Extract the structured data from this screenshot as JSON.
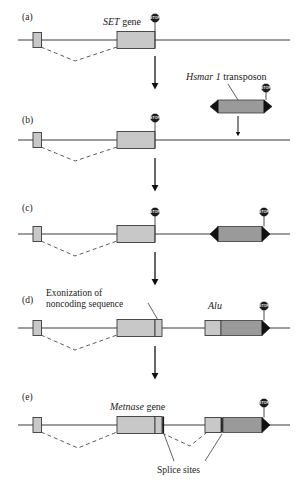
{
  "figure": {
    "background_color": "#ffffff",
    "line_color": "#3a3a3a",
    "exon_fill_light": "#c8c8c8",
    "exon_fill_dark": "#9a9a9a",
    "inverted_repeat_fill": "#111111",
    "stop_sign_fill": "#1c1c1c",
    "stop_sign_text": "STOP",
    "dashed_intron_color": "#4a4a4a"
  },
  "panels": [
    {
      "id": "a",
      "label": "(a)",
      "labels": [
        {
          "name": "set-gene-label",
          "italic_part": "SET",
          "regular_part": " gene",
          "text": "SET gene"
        }
      ],
      "elements": [
        {
          "type": "small-exon",
          "fill": "#c8c8c8"
        },
        {
          "type": "set-gene-exon",
          "fill": "#c8c8c8"
        },
        {
          "type": "stop-sign",
          "text": "STOP"
        },
        {
          "type": "intron-dashed-line"
        },
        {
          "type": "genomic-backbone"
        }
      ]
    },
    {
      "id": "b",
      "label": "(b)",
      "labels": [
        {
          "name": "hsmar1-transposon-label",
          "italic_part": "Hsmar 1",
          "regular_part": " transposon",
          "text": "Hsmar 1 transposon"
        }
      ],
      "elements": [
        {
          "type": "small-exon",
          "fill": "#c8c8c8"
        },
        {
          "type": "set-gene-exon",
          "fill": "#c8c8c8"
        },
        {
          "type": "stop-sign",
          "text": "STOP"
        },
        {
          "type": "transposon",
          "fill": "#9a9a9a",
          "ends": "inverted-repeat-arrowheads"
        },
        {
          "type": "stop-sign",
          "text": "STOP"
        },
        {
          "type": "insertion-arrow"
        },
        {
          "type": "genomic-backbone"
        }
      ]
    },
    {
      "id": "c",
      "label": "(c)",
      "labels": [],
      "elements": [
        {
          "type": "small-exon",
          "fill": "#c8c8c8"
        },
        {
          "type": "set-gene-exon",
          "fill": "#c8c8c8"
        },
        {
          "type": "stop-sign",
          "text": "STOP"
        },
        {
          "type": "integrated-transposon",
          "fill": "#9a9a9a"
        },
        {
          "type": "stop-sign",
          "text": "STOP"
        },
        {
          "type": "genomic-backbone"
        }
      ]
    },
    {
      "id": "d",
      "label": "(d)",
      "labels": [
        {
          "name": "exonization-label",
          "line1": "Exonization of",
          "line2": "noncoding sequence",
          "text": "Exonization of noncoding sequence"
        },
        {
          "name": "alu-label",
          "italic_part": "Alu",
          "regular_part": "",
          "text": "Alu"
        }
      ],
      "elements": [
        {
          "type": "small-exon",
          "fill": "#c8c8c8"
        },
        {
          "type": "set-gene-exon",
          "fill": "#c8c8c8"
        },
        {
          "type": "new-exon",
          "fill": "#c8c8c8"
        },
        {
          "type": "alu-element",
          "fill": "#c8c8c8"
        },
        {
          "type": "integrated-transposon",
          "fill": "#9a9a9a"
        },
        {
          "type": "stop-sign",
          "text": "STOP"
        },
        {
          "type": "genomic-backbone"
        }
      ]
    },
    {
      "id": "e",
      "label": "(e)",
      "labels": [
        {
          "name": "metnase-gene-label",
          "italic_part": "Metnase",
          "regular_part": " gene",
          "text": "Metnase gene"
        },
        {
          "name": "splice-sites-label",
          "text": "Splice sites"
        }
      ],
      "elements": [
        {
          "type": "small-exon",
          "fill": "#c8c8c8"
        },
        {
          "type": "set-gene-exon",
          "fill": "#c8c8c8"
        },
        {
          "type": "splice-site-marker"
        },
        {
          "type": "alu-element",
          "fill": "#c8c8c8"
        },
        {
          "type": "splice-site-marker"
        },
        {
          "type": "integrated-transposon",
          "fill": "#9a9a9a"
        },
        {
          "type": "stop-sign",
          "text": "STOP"
        },
        {
          "type": "genomic-backbone"
        }
      ]
    }
  ],
  "flow_arrows": [
    {
      "name": "arrow-a-to-b",
      "direction": "down"
    },
    {
      "name": "arrow-b-to-c",
      "direction": "down"
    },
    {
      "name": "arrow-c-to-d",
      "direction": "down"
    },
    {
      "name": "arrow-d-to-e",
      "direction": "down"
    }
  ]
}
